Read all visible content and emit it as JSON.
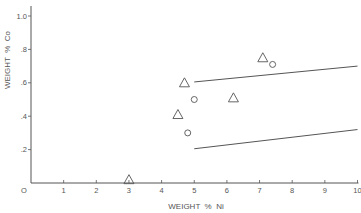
{
  "chart_data": {
    "type": "scatter",
    "title": "",
    "xlabel": "WEIGHT  %  Ni",
    "ylabel": "WEIGHT  %  Co",
    "xlim": [
      0,
      10
    ],
    "ylim": [
      0,
      1.05
    ],
    "grid": false,
    "x_ticks": [
      {
        "v": 0,
        "label": "O"
      },
      {
        "v": 1,
        "label": "1"
      },
      {
        "v": 2,
        "label": "2"
      },
      {
        "v": 3,
        "label": "3"
      },
      {
        "v": 4,
        "label": "4"
      },
      {
        "v": 5,
        "label": "5"
      },
      {
        "v": 6,
        "label": "6"
      },
      {
        "v": 7,
        "label": "7"
      },
      {
        "v": 8,
        "label": "8"
      },
      {
        "v": 9,
        "label": "9"
      },
      {
        "v": 10,
        "label": "10"
      }
    ],
    "y_ticks": [
      {
        "v": 0.2,
        "label": ".2"
      },
      {
        "v": 0.4,
        "label": ".4"
      },
      {
        "v": 0.6,
        "label": ".6"
      },
      {
        "v": 0.8,
        "label": ".8"
      },
      {
        "v": 1.0,
        "label": "1.0"
      }
    ],
    "series": [
      {
        "name": "triangles",
        "marker": "triangle",
        "points": [
          {
            "x": 3.0,
            "y": 0.02
          },
          {
            "x": 4.5,
            "y": 0.41
          },
          {
            "x": 4.7,
            "y": 0.6
          },
          {
            "x": 6.2,
            "y": 0.51
          },
          {
            "x": 7.1,
            "y": 0.75
          }
        ]
      },
      {
        "name": "circles",
        "marker": "circle",
        "points": [
          {
            "x": 4.8,
            "y": 0.3
          },
          {
            "x": 5.0,
            "y": 0.5
          },
          {
            "x": 7.4,
            "y": 0.71
          }
        ]
      }
    ],
    "lines": [
      {
        "name": "upper-bound",
        "x": [
          5.0,
          10.0
        ],
        "y": [
          0.605,
          0.7
        ]
      },
      {
        "name": "lower-bound",
        "x": [
          5.0,
          10.0
        ],
        "y": [
          0.205,
          0.32
        ]
      }
    ]
  },
  "colors": {
    "ink": "#555555",
    "background": "#ffffff"
  }
}
